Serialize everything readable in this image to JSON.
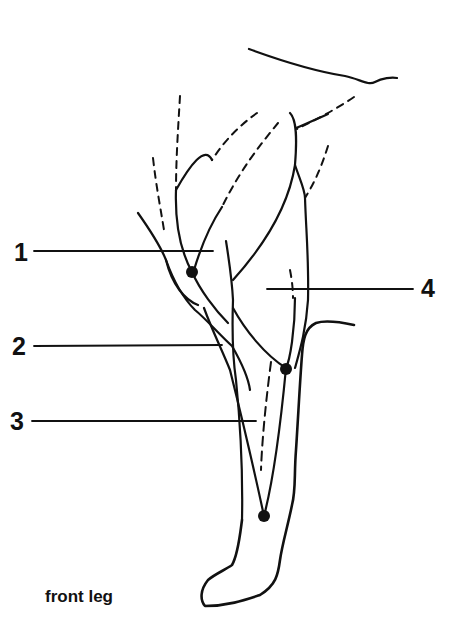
{
  "figure": {
    "caption": "front leg",
    "labels": [
      {
        "id": "1",
        "text": "1",
        "side": "left",
        "y": 252
      },
      {
        "id": "2",
        "text": "2",
        "side": "left",
        "y": 346
      },
      {
        "id": "3",
        "text": "3",
        "side": "left",
        "y": 421
      },
      {
        "id": "4",
        "text": "4",
        "side": "right",
        "y": 288
      }
    ],
    "points": [
      {
        "name": "point-1",
        "x": 192,
        "y": 272
      },
      {
        "name": "point-2",
        "x": 286,
        "y": 369
      },
      {
        "name": "point-3",
        "x": 264,
        "y": 516
      }
    ],
    "colors": {
      "line": "#111111",
      "background": "#ffffff"
    }
  }
}
